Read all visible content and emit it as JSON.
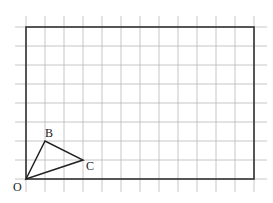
{
  "diagram": {
    "type": "grid-with-triangle",
    "grid": {
      "cols": 12,
      "rows": 8,
      "cell_px": 19,
      "origin_px": [
        26,
        179
      ],
      "grid_color": "#b8b8b8",
      "border_color": "#333333"
    },
    "points": [
      {
        "label": "O",
        "x": 0,
        "y": 0
      },
      {
        "label": "B",
        "x": 1,
        "y": 2
      },
      {
        "label": "C",
        "x": 3,
        "y": 1
      }
    ],
    "triangle": [
      "O",
      "B",
      "C"
    ],
    "labels": {
      "O": "O",
      "B": "B",
      "C": "C"
    }
  }
}
